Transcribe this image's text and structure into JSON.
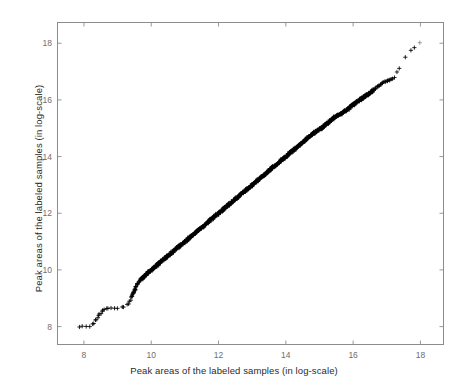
{
  "chart_data": {
    "type": "scatter",
    "title": "",
    "xlabel": "Peak areas of the labeled samples (in log-scale)",
    "ylabel": "Peak areas of the labeled samples (in log-scale)",
    "xlim": [
      7.2,
      18.7
    ],
    "ylim": [
      7.35,
      18.75
    ],
    "xticks": [
      8,
      10,
      12,
      14,
      16,
      18
    ],
    "yticks": [
      8,
      10,
      12,
      14,
      16,
      18
    ],
    "xticklabels": [
      "8",
      "10",
      "12",
      "14",
      "16",
      "18"
    ],
    "yticklabels": [
      "8",
      "10",
      "12",
      "14",
      "16",
      "18"
    ],
    "grid": false,
    "legend": false,
    "marker": "plus",
    "marker_color": "#000000",
    "marker_size": 3,
    "series": [
      {
        "name": "labeled samples",
        "description": "Near-identity diagonal band of peak areas; dense overlapping core from 9.6 to 16.5, sparse tails at both ends with a slight S-shaped departure from y=x.",
        "points": [
          [
            7.8,
            8.0
          ],
          [
            7.98,
            8.0
          ],
          [
            8.12,
            8.0
          ],
          [
            8.22,
            8.02
          ],
          [
            8.28,
            8.1
          ],
          [
            8.33,
            8.18
          ],
          [
            8.36,
            8.24
          ],
          [
            8.4,
            8.3
          ],
          [
            8.43,
            8.36
          ],
          [
            8.46,
            8.42
          ],
          [
            8.49,
            8.47
          ],
          [
            8.52,
            8.52
          ],
          [
            8.55,
            8.56
          ],
          [
            8.58,
            8.59
          ],
          [
            8.62,
            8.62
          ],
          [
            8.68,
            8.64
          ],
          [
            8.76,
            8.65
          ],
          [
            8.86,
            8.66
          ],
          [
            8.97,
            8.66
          ],
          [
            9.08,
            8.67
          ],
          [
            9.18,
            8.68
          ],
          [
            9.26,
            8.72
          ],
          [
            9.31,
            8.78
          ],
          [
            9.35,
            8.86
          ],
          [
            9.38,
            8.94
          ],
          [
            9.41,
            9.02
          ],
          [
            9.44,
            9.1
          ],
          [
            9.47,
            9.18
          ],
          [
            9.5,
            9.26
          ],
          [
            9.53,
            9.34
          ],
          [
            9.56,
            9.42
          ],
          [
            9.59,
            9.49
          ],
          [
            9.62,
            9.55
          ],
          [
            9.66,
            9.6
          ],
          [
            9.7,
            9.66
          ],
          [
            9.75,
            9.72
          ],
          [
            9.8,
            9.78
          ],
          [
            9.85,
            9.84
          ],
          [
            9.9,
            9.9
          ],
          [
            9.96,
            9.96
          ],
          [
            10.02,
            10.02
          ],
          [
            10.08,
            10.08
          ],
          [
            10.14,
            10.14
          ],
          [
            10.2,
            10.2
          ],
          [
            10.26,
            10.26
          ],
          [
            10.32,
            10.32
          ],
          [
            10.38,
            10.38
          ],
          [
            10.44,
            10.44
          ],
          [
            10.5,
            10.5
          ],
          [
            10.56,
            10.56
          ],
          [
            10.62,
            10.62
          ],
          [
            10.68,
            10.68
          ],
          [
            10.74,
            10.74
          ],
          [
            10.8,
            10.8
          ],
          [
            10.86,
            10.86
          ],
          [
            10.92,
            10.92
          ],
          [
            10.98,
            10.98
          ],
          [
            11.04,
            11.04
          ],
          [
            11.1,
            11.1
          ],
          [
            11.16,
            11.16
          ],
          [
            11.22,
            11.22
          ],
          [
            11.28,
            11.28
          ],
          [
            11.34,
            11.34
          ],
          [
            11.4,
            11.4
          ],
          [
            11.46,
            11.46
          ],
          [
            11.52,
            11.52
          ],
          [
            11.58,
            11.58
          ],
          [
            11.64,
            11.64
          ],
          [
            11.7,
            11.7
          ],
          [
            11.76,
            11.76
          ],
          [
            11.82,
            11.82
          ],
          [
            11.88,
            11.88
          ],
          [
            11.94,
            11.94
          ],
          [
            12.0,
            12.0
          ],
          [
            12.06,
            12.06
          ],
          [
            12.12,
            12.12
          ],
          [
            12.18,
            12.18
          ],
          [
            12.24,
            12.24
          ],
          [
            12.3,
            12.3
          ],
          [
            12.36,
            12.36
          ],
          [
            12.42,
            12.42
          ],
          [
            12.48,
            12.48
          ],
          [
            12.54,
            12.54
          ],
          [
            12.6,
            12.6
          ],
          [
            12.66,
            12.66
          ],
          [
            12.72,
            12.72
          ],
          [
            12.78,
            12.78
          ],
          [
            12.84,
            12.84
          ],
          [
            12.9,
            12.9
          ],
          [
            12.96,
            12.96
          ],
          [
            13.02,
            13.02
          ],
          [
            13.08,
            13.08
          ],
          [
            13.14,
            13.14
          ],
          [
            13.2,
            13.2
          ],
          [
            13.26,
            13.26
          ],
          [
            13.32,
            13.32
          ],
          [
            13.38,
            13.38
          ],
          [
            13.44,
            13.44
          ],
          [
            13.5,
            13.5
          ],
          [
            13.56,
            13.56
          ],
          [
            13.62,
            13.62
          ],
          [
            13.68,
            13.68
          ],
          [
            13.74,
            13.74
          ],
          [
            13.8,
            13.8
          ],
          [
            13.86,
            13.86
          ],
          [
            13.92,
            13.92
          ],
          [
            13.98,
            13.98
          ],
          [
            14.04,
            14.04
          ],
          [
            14.1,
            14.1
          ],
          [
            14.16,
            14.16
          ],
          [
            14.22,
            14.22
          ],
          [
            14.28,
            14.28
          ],
          [
            14.34,
            14.34
          ],
          [
            14.4,
            14.4
          ],
          [
            14.46,
            14.46
          ],
          [
            14.52,
            14.52
          ],
          [
            14.58,
            14.58
          ],
          [
            14.64,
            14.64
          ],
          [
            14.7,
            14.7
          ],
          [
            14.76,
            14.76
          ],
          [
            14.82,
            14.82
          ],
          [
            14.88,
            14.88
          ],
          [
            14.94,
            14.92
          ],
          [
            15.0,
            14.96
          ],
          [
            15.06,
            15.0
          ],
          [
            15.12,
            15.06
          ],
          [
            15.18,
            15.12
          ],
          [
            15.24,
            15.18
          ],
          [
            15.3,
            15.24
          ],
          [
            15.36,
            15.3
          ],
          [
            15.42,
            15.36
          ],
          [
            15.48,
            15.41
          ],
          [
            15.54,
            15.45
          ],
          [
            15.6,
            15.49
          ],
          [
            15.66,
            15.53
          ],
          [
            15.73,
            15.58
          ],
          [
            15.8,
            15.64
          ],
          [
            15.87,
            15.7
          ],
          [
            15.93,
            15.76
          ],
          [
            15.99,
            15.82
          ],
          [
            16.05,
            15.88
          ],
          [
            16.11,
            15.93
          ],
          [
            16.17,
            15.98
          ],
          [
            16.23,
            16.03
          ],
          [
            16.29,
            16.08
          ],
          [
            16.35,
            16.13
          ],
          [
            16.41,
            16.18
          ],
          [
            16.47,
            16.23
          ],
          [
            16.54,
            16.29
          ],
          [
            16.61,
            16.36
          ],
          [
            16.68,
            16.43
          ],
          [
            16.75,
            16.5
          ],
          [
            16.82,
            16.56
          ],
          [
            16.89,
            16.61
          ],
          [
            16.95,
            16.64
          ],
          [
            17.01,
            16.67
          ],
          [
            17.07,
            16.7
          ],
          [
            17.13,
            16.73
          ],
          [
            17.19,
            16.76
          ],
          [
            17.27,
            16.86
          ],
          [
            17.33,
            17.02
          ],
          [
            17.38,
            17.18
          ],
          [
            17.62,
            17.62
          ],
          [
            17.98,
            18.02
          ]
        ]
      }
    ]
  },
  "axes": {
    "x_axis_label": "Peak areas of the labeled samples (in log-scale)",
    "y_axis_label": "Peak areas of the labeled samples (in log-scale)"
  }
}
